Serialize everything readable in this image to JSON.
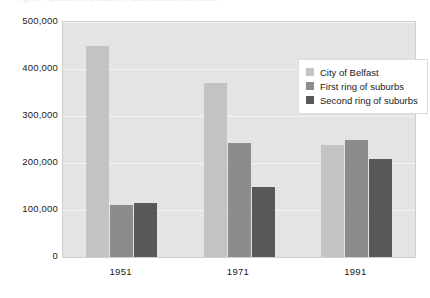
{
  "clipped_caption": "Figure  Population of Belfast city and suburbs, 1951-1991",
  "chart_data": {
    "type": "bar",
    "title": "",
    "xlabel": "",
    "ylabel": "",
    "categories": [
      "1951",
      "1971",
      "1991"
    ],
    "series": [
      {
        "name": "City of Belfast",
        "color": "#c3c3c3",
        "values": [
          450000,
          370000,
          238000
        ]
      },
      {
        "name": "First ring of suburbs",
        "color": "#8c8c8c",
        "values": [
          110000,
          243000,
          250000
        ]
      },
      {
        "name": "Second ring of suburbs",
        "color": "#585858",
        "values": [
          115000,
          150000,
          208000
        ]
      }
    ],
    "ylim": [
      0,
      500000
    ],
    "ytick_labels": [
      "500,000",
      "400,000",
      "300,000",
      "200,000",
      "100,000",
      "0"
    ],
    "ytick_values": [
      500000,
      400000,
      300000,
      200000,
      100000,
      0
    ],
    "grid": true,
    "legend_position": "upper right",
    "plot_background": "#e4e4e4",
    "grid_color": "#f4f4f4"
  },
  "legend": {
    "items": [
      {
        "label": "City of Belfast"
      },
      {
        "label": "First ring of suburbs"
      },
      {
        "label": "Second ring of suburbs"
      }
    ]
  }
}
